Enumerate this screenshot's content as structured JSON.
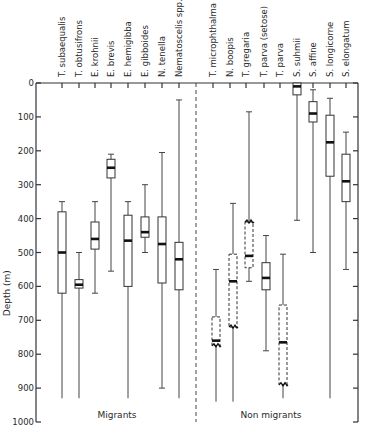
{
  "chart_data": {
    "type": "boxplot",
    "title": "",
    "xlabel": "",
    "ylabel": "Depth (m)",
    "ylim": [
      0,
      1000
    ],
    "y_inverted": true,
    "y_ticks": [
      0,
      100,
      200,
      300,
      400,
      500,
      600,
      700,
      800,
      900,
      1000
    ],
    "grid": false,
    "groups": [
      {
        "label": "Migrants",
        "categories": [
          "T. subaequalis",
          "T. obtusifrons",
          "E. krohnii",
          "E. brevis",
          "E. hemigibba",
          "E. gibboides",
          "N. tenella",
          "Nematoscelis spp."
        ]
      },
      {
        "label": "Non migrants",
        "categories": [
          "T. microphthalma",
          "N. boopis",
          "T. gregaria",
          "T. parva (setose)",
          "T. parva",
          "S. suhmii",
          "S. affine",
          "S. longicorne",
          "S. elongatum"
        ]
      }
    ],
    "series": [
      {
        "name": "T. subaequalis",
        "group": "Migrants",
        "whisker_min": 350,
        "q1": 380,
        "median": 500,
        "q3": 620,
        "whisker_max": 930,
        "box_style": "solid"
      },
      {
        "name": "T. obtusifrons",
        "group": "Migrants",
        "whisker_min": 500,
        "q1": 580,
        "median": 595,
        "q3": 605,
        "whisker_max": 930,
        "box_style": "solid"
      },
      {
        "name": "E. krohnii",
        "group": "Migrants",
        "whisker_min": 350,
        "q1": 410,
        "median": 460,
        "q3": 490,
        "whisker_max": 620,
        "box_style": "solid"
      },
      {
        "name": "E. brevis",
        "group": "Migrants",
        "whisker_min": 210,
        "q1": 225,
        "median": 250,
        "q3": 280,
        "whisker_max": 555,
        "box_style": "solid"
      },
      {
        "name": "E. hemigibba",
        "group": "Migrants",
        "whisker_min": 350,
        "q1": 390,
        "median": 465,
        "q3": 600,
        "whisker_max": 930,
        "box_style": "solid"
      },
      {
        "name": "E. gibboides",
        "group": "Migrants",
        "whisker_min": 300,
        "q1": 395,
        "median": 440,
        "q3": 455,
        "whisker_max": 500,
        "box_style": "solid"
      },
      {
        "name": "N. tenella",
        "group": "Migrants",
        "whisker_min": 205,
        "q1": 395,
        "median": 475,
        "q3": 590,
        "whisker_max": 900,
        "box_style": "solid"
      },
      {
        "name": "Nematoscelis spp.",
        "group": "Migrants",
        "whisker_min": 50,
        "q1": 470,
        "median": 520,
        "q3": 610,
        "whisker_max": 930,
        "box_style": "solid"
      },
      {
        "name": "T. microphthalma",
        "group": "Non migrants",
        "whisker_min": 550,
        "q1": 690,
        "median": 760,
        "q3": 775,
        "whisker_max": 940,
        "box_style": "dashed",
        "open_end": "bottom"
      },
      {
        "name": "N. boopis",
        "group": "Non migrants",
        "whisker_min": 355,
        "q1": 505,
        "median": 585,
        "q3": 720,
        "whisker_max": 940,
        "box_style": "dashed",
        "open_end": "bottom"
      },
      {
        "name": "T. gregaria",
        "group": "Non migrants",
        "whisker_min": 85,
        "q1": 410,
        "median": 510,
        "q3": 545,
        "whisker_max": 585,
        "box_style": "dashed",
        "open_end": "top"
      },
      {
        "name": "T. parva (setose)",
        "group": "Non migrants",
        "whisker_min": 450,
        "q1": 530,
        "median": 575,
        "q3": 610,
        "whisker_max": 790,
        "box_style": "solid"
      },
      {
        "name": "T. parva",
        "group": "Non migrants",
        "whisker_min": 505,
        "q1": 655,
        "median": 765,
        "q3": 890,
        "whisker_max": 930,
        "box_style": "dashed",
        "open_end": "bottom"
      },
      {
        "name": "S. suhmii",
        "group": "Non migrants",
        "whisker_min": 0,
        "q1": 0,
        "median": 10,
        "q3": 35,
        "whisker_max": 405,
        "box_style": "solid"
      },
      {
        "name": "S. affine",
        "group": "Non migrants",
        "whisker_min": 20,
        "q1": 55,
        "median": 90,
        "q3": 115,
        "whisker_max": 500,
        "box_style": "solid"
      },
      {
        "name": "S. longicorne",
        "group": "Non migrants",
        "whisker_min": 45,
        "q1": 95,
        "median": 175,
        "q3": 275,
        "whisker_max": 930,
        "box_style": "solid"
      },
      {
        "name": "S. elongatum",
        "group": "Non migrants",
        "whisker_min": 145,
        "q1": 210,
        "median": 290,
        "q3": 350,
        "whisker_max": 550,
        "box_style": "solid"
      }
    ]
  }
}
